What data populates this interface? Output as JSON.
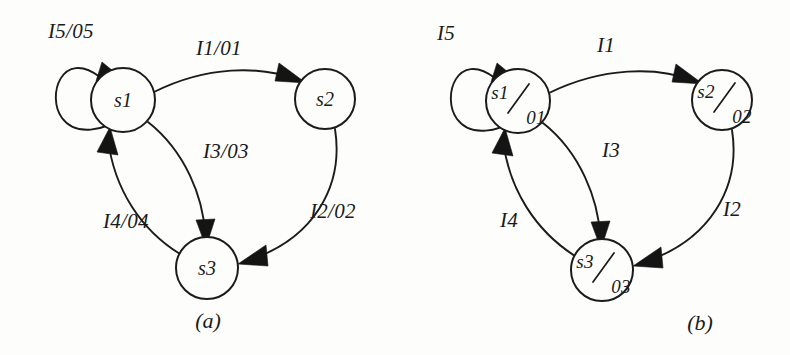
{
  "figure": {
    "kind": "state-transition-diagram-pair",
    "ink_color": "#1a1a1a",
    "paper_color": "#fdfdfc"
  },
  "panel_a": {
    "caption": "(a)",
    "nodes": [
      {
        "id": "s1",
        "label": "s1",
        "cx": 123,
        "cy": 100,
        "r": 32
      },
      {
        "id": "s2",
        "label": "s2",
        "cx": 325,
        "cy": 99,
        "r": 30
      },
      {
        "id": "s3",
        "label": "s3",
        "cx": 207,
        "cy": 268,
        "r": 31
      }
    ],
    "edges": [
      {
        "id": "a-self-s1",
        "from": "s1",
        "to": "s1",
        "label": "I5/05",
        "label_x": 48,
        "label_y": 38
      },
      {
        "id": "a-s1-s2",
        "from": "s1",
        "to": "s2",
        "label": "I1/01",
        "label_x": 196,
        "label_y": 55
      },
      {
        "id": "a-s2-s3",
        "from": "s2",
        "to": "s3",
        "label": "I2/02",
        "label_x": 310,
        "label_y": 218
      },
      {
        "id": "a-s1-s3",
        "from": "s1",
        "to": "s3",
        "label": "I3/03",
        "label_x": 203,
        "label_y": 158
      },
      {
        "id": "a-s3-s1",
        "from": "s3",
        "to": "s1",
        "label": "I4/04",
        "label_x": 103,
        "label_y": 228
      }
    ]
  },
  "panel_b": {
    "caption": "(b)",
    "nodes": [
      {
        "id": "s1",
        "label_state": "s1",
        "label_output": "01",
        "cx": 518,
        "cy": 101,
        "r": 32
      },
      {
        "id": "s2",
        "label_state": "s2",
        "label_output": "02",
        "cx": 722,
        "cy": 100,
        "r": 30
      },
      {
        "id": "s3",
        "label_state": "s3",
        "label_output": "03",
        "cx": 602,
        "cy": 270,
        "r": 31
      }
    ],
    "edges": [
      {
        "id": "b-self-s1",
        "from": "s1",
        "to": "s1",
        "label": "I5",
        "label_x": 437,
        "label_y": 40
      },
      {
        "id": "b-s1-s2",
        "from": "s1",
        "to": "s2",
        "label": "I1",
        "label_x": 597,
        "label_y": 52
      },
      {
        "id": "b-s2-s3",
        "from": "s2",
        "to": "s3",
        "label": "I2",
        "label_x": 723,
        "label_y": 216
      },
      {
        "id": "b-s1-s3",
        "from": "s1",
        "to": "s3",
        "label": "I3",
        "label_x": 602,
        "label_y": 157
      },
      {
        "id": "b-s3-s1",
        "from": "s3",
        "to": "s1",
        "label": "I4",
        "label_x": 500,
        "label_y": 227
      }
    ]
  },
  "captions": {
    "a_x": 208,
    "a_y": 328,
    "b_x": 700,
    "b_y": 330
  }
}
